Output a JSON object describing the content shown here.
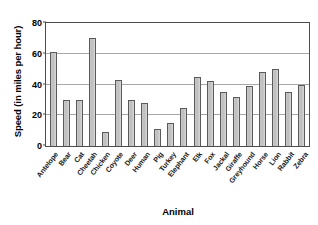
{
  "chart_data": {
    "type": "bar",
    "title": "",
    "xlabel": "Animal",
    "ylabel": "Speed (in miles per hour)",
    "ylim": [
      0,
      80
    ],
    "yticks": [
      0,
      20,
      40,
      60,
      80
    ],
    "grid": true,
    "legend": "none",
    "orientation": "vertical",
    "categories": [
      "Antelope",
      "Bear",
      "Cat",
      "Cheetah",
      "Chicken",
      "Coyote",
      "Deer",
      "Human",
      "Pig",
      "Turkey",
      "Elephant",
      "Elk",
      "Fox",
      "Jackal",
      "Giraffe",
      "Greyhound",
      "Horse",
      "Lion",
      "Rabbit",
      "Zebra"
    ],
    "values": [
      61,
      30,
      30,
      70,
      9,
      43,
      30,
      28,
      11,
      15,
      25,
      45,
      42,
      35,
      32,
      39,
      48,
      50,
      35,
      40
    ],
    "bar_color": "#c4c4c4",
    "bar_edge_color": "#5a5a5a",
    "grid_color": "#a8a8a8",
    "axis_color": "#4d4d4d"
  }
}
